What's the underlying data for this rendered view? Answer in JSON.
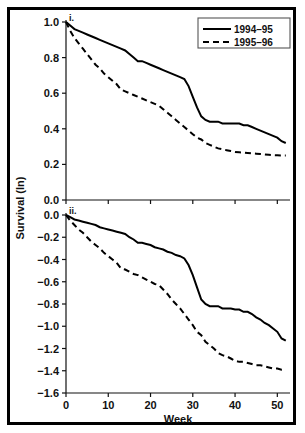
{
  "figure": {
    "ylabel": "Survival (ln)",
    "xlabel": "Week",
    "border_color": "#000000"
  },
  "legend": {
    "entries": [
      {
        "label": "1994–95",
        "style": "solid"
      },
      {
        "label": "1995–96",
        "style": "dashed"
      }
    ]
  },
  "panels": {
    "top": {
      "tag": "i."
    },
    "bottom": {
      "tag": "ii."
    }
  },
  "axis_text": {
    "top_y_ticks": [
      "0.0",
      "0.2",
      "0.4",
      "0.6",
      "0.8",
      "1.0"
    ],
    "bottom_y_ticks": [
      "-1.6",
      "-1.4",
      "-1.2",
      "-1.0",
      "-0.8",
      "-0.6",
      "-0.4",
      "-0.2",
      "0.0"
    ],
    "x_ticks": [
      "0",
      "10",
      "20",
      "30",
      "40",
      "50"
    ]
  },
  "chart_data": [
    {
      "type": "line",
      "id": "panel-i",
      "title": "i.",
      "xlabel": "",
      "ylabel": "Survival (ln)",
      "xlim": [
        0,
        53
      ],
      "ylim": [
        0.0,
        1.0
      ],
      "yticks": [
        0.0,
        0.2,
        0.4,
        0.6,
        0.8,
        1.0
      ],
      "xticks": [
        0,
        10,
        20,
        30,
        40,
        50
      ],
      "grid": false,
      "legend_position": "top-right",
      "x": [
        0,
        1,
        2,
        3,
        4,
        5,
        6,
        7,
        8,
        9,
        10,
        11,
        12,
        13,
        14,
        15,
        16,
        17,
        18,
        19,
        20,
        21,
        22,
        23,
        24,
        25,
        26,
        27,
        28,
        29,
        30,
        31,
        32,
        33,
        34,
        35,
        36,
        37,
        38,
        39,
        40,
        41,
        42,
        43,
        44,
        45,
        46,
        47,
        48,
        49,
        50,
        51,
        52
      ],
      "series": [
        {
          "name": "1994–95",
          "style": "solid",
          "color": "#000000",
          "values": [
            1.0,
            0.98,
            0.96,
            0.95,
            0.94,
            0.93,
            0.92,
            0.91,
            0.9,
            0.89,
            0.88,
            0.87,
            0.86,
            0.85,
            0.84,
            0.82,
            0.8,
            0.78,
            0.78,
            0.77,
            0.76,
            0.75,
            0.74,
            0.73,
            0.72,
            0.71,
            0.7,
            0.69,
            0.68,
            0.64,
            0.58,
            0.52,
            0.47,
            0.45,
            0.44,
            0.44,
            0.44,
            0.43,
            0.43,
            0.43,
            0.43,
            0.43,
            0.42,
            0.42,
            0.41,
            0.4,
            0.39,
            0.38,
            0.37,
            0.36,
            0.35,
            0.33,
            0.32
          ]
        },
        {
          "name": "1995–96",
          "style": "dashed",
          "color": "#000000",
          "values": [
            1.0,
            0.95,
            0.91,
            0.88,
            0.85,
            0.82,
            0.79,
            0.76,
            0.74,
            0.71,
            0.69,
            0.67,
            0.65,
            0.62,
            0.61,
            0.6,
            0.59,
            0.58,
            0.57,
            0.56,
            0.55,
            0.54,
            0.53,
            0.51,
            0.49,
            0.47,
            0.45,
            0.43,
            0.41,
            0.39,
            0.37,
            0.35,
            0.34,
            0.32,
            0.31,
            0.3,
            0.29,
            0.285,
            0.28,
            0.275,
            0.27,
            0.268,
            0.266,
            0.264,
            0.262,
            0.26,
            0.258,
            0.256,
            0.254,
            0.252,
            0.251,
            0.25,
            0.25
          ]
        }
      ]
    },
    {
      "type": "line",
      "id": "panel-ii",
      "title": "ii.",
      "xlabel": "Week",
      "ylabel": "Survival (ln)",
      "xlim": [
        0,
        53
      ],
      "ylim": [
        -1.6,
        0.0
      ],
      "yticks": [
        -1.6,
        -1.4,
        -1.2,
        -1.0,
        -0.8,
        -0.6,
        -0.4,
        -0.2,
        0.0
      ],
      "xticks": [
        0,
        10,
        20,
        30,
        40,
        50
      ],
      "grid": false,
      "legend_position": "none",
      "x": [
        0,
        1,
        2,
        3,
        4,
        5,
        6,
        7,
        8,
        9,
        10,
        11,
        12,
        13,
        14,
        15,
        16,
        17,
        18,
        19,
        20,
        21,
        22,
        23,
        24,
        25,
        26,
        27,
        28,
        29,
        30,
        31,
        32,
        33,
        34,
        35,
        36,
        37,
        38,
        39,
        40,
        41,
        42,
        43,
        44,
        45,
        46,
        47,
        48,
        49,
        50,
        51,
        52
      ],
      "series": [
        {
          "name": "1994–95",
          "style": "solid",
          "color": "#000000",
          "values": [
            0.0,
            -0.02,
            -0.04,
            -0.05,
            -0.06,
            -0.07,
            -0.08,
            -0.09,
            -0.11,
            -0.12,
            -0.13,
            -0.14,
            -0.15,
            -0.16,
            -0.17,
            -0.2,
            -0.22,
            -0.25,
            -0.25,
            -0.26,
            -0.27,
            -0.29,
            -0.3,
            -0.31,
            -0.33,
            -0.34,
            -0.36,
            -0.37,
            -0.39,
            -0.45,
            -0.54,
            -0.65,
            -0.76,
            -0.8,
            -0.82,
            -0.82,
            -0.82,
            -0.84,
            -0.84,
            -0.84,
            -0.85,
            -0.85,
            -0.87,
            -0.87,
            -0.89,
            -0.92,
            -0.94,
            -0.97,
            -0.99,
            -1.02,
            -1.05,
            -1.11,
            -1.13
          ]
        },
        {
          "name": "1995–96",
          "style": "dashed",
          "color": "#000000",
          "values": [
            0.0,
            -0.05,
            -0.09,
            -0.13,
            -0.16,
            -0.2,
            -0.24,
            -0.27,
            -0.3,
            -0.34,
            -0.37,
            -0.4,
            -0.43,
            -0.48,
            -0.49,
            -0.51,
            -0.53,
            -0.54,
            -0.56,
            -0.58,
            -0.6,
            -0.62,
            -0.63,
            -0.67,
            -0.71,
            -0.76,
            -0.8,
            -0.84,
            -0.89,
            -0.94,
            -0.99,
            -1.05,
            -1.08,
            -1.14,
            -1.17,
            -1.2,
            -1.24,
            -1.26,
            -1.27,
            -1.29,
            -1.31,
            -1.32,
            -1.32,
            -1.33,
            -1.34,
            -1.35,
            -1.35,
            -1.36,
            -1.37,
            -1.38,
            -1.38,
            -1.39,
            -1.39
          ]
        }
      ]
    }
  ]
}
